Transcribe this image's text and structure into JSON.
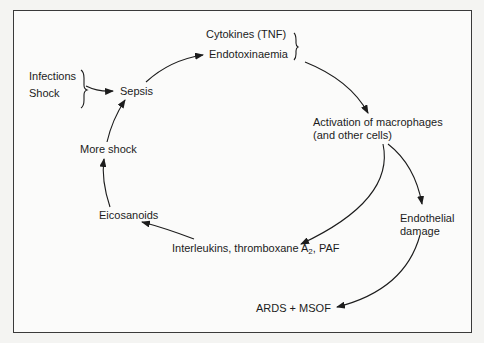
{
  "diagram": {
    "type": "cycle",
    "nodes": {
      "infections": "Infections",
      "shock": "Shock",
      "sepsis": "Sepsis",
      "cytokines": "Cytokines (TNF)",
      "endotoxinaemia": "Endotoxinaemia",
      "activation_line1": "Activation of macrophages",
      "activation_line2": "(and other cells)",
      "endothelial_line1": "Endothelial",
      "endothelial_line2": "damage",
      "interleukins_pre": "Interleukins, thromboxane A",
      "interleukins_sub": "2",
      "interleukins_post": ", PAF",
      "eicosanoids": "Eicosanoids",
      "more_shock": "More shock",
      "ards": "ARDS + MSOF"
    },
    "edges": [
      {
        "from": "Infections/Shock",
        "to": "Sepsis"
      },
      {
        "from": "Sepsis",
        "to": "Cytokines (TNF) / Endotoxinaemia"
      },
      {
        "from": "Cytokines (TNF) / Endotoxinaemia",
        "to": "Activation of macrophages (and other cells)"
      },
      {
        "from": "Activation of macrophages (and other cells)",
        "to": "Endothelial damage"
      },
      {
        "from": "Activation of macrophages (and other cells)",
        "to": "Interleukins, thromboxane A2, PAF"
      },
      {
        "from": "Interleukins, thromboxane A2, PAF",
        "to": "Eicosanoids"
      },
      {
        "from": "Eicosanoids",
        "to": "More shock"
      },
      {
        "from": "More shock",
        "to": "Sepsis"
      },
      {
        "from": "Endothelial damage",
        "to": "ARDS + MSOF"
      }
    ],
    "colors": {
      "ink": "#1c1c1c",
      "frame": "#3a3a3a",
      "paper": "#fbfbfa"
    }
  }
}
